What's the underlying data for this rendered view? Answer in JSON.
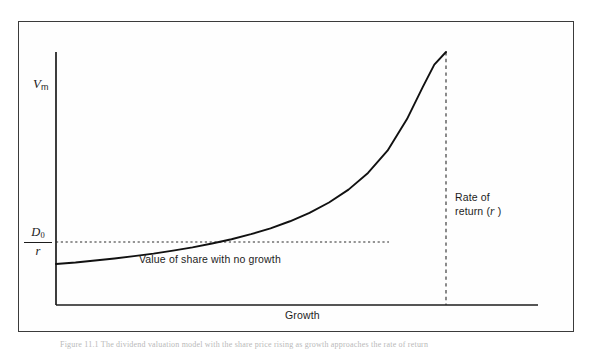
{
  "figure": {
    "kind": "line",
    "background_color": "#ffffff",
    "border_color": "#3b3b3b",
    "ink_color": "#1c1c1c",
    "caption": "Figure 11.1  The dividend valuation model with the share price rising as growth approaches the rate of return"
  },
  "axes": {
    "y_axis_label_main": "V",
    "y_axis_label_sub": "m",
    "x_axis_label": "Growth",
    "origin_value_numerator": "D",
    "origin_value_numerator_sub": "0",
    "origin_value_denominator": "r"
  },
  "annotations": {
    "asymptote_label": "Value of share with no growth",
    "vertical_asymptote_line1": "Rate of",
    "vertical_asymptote_line2": "return (",
    "vertical_asymptote_italic": "r",
    "vertical_asymptote_line3": " )"
  },
  "chart_data": {
    "type": "line",
    "title": "",
    "xlabel": "Growth",
    "ylabel": "Vm",
    "grid": false,
    "legend": "none",
    "xlim": [
      0,
      1
    ],
    "ylim": [
      0,
      1
    ],
    "series": [
      {
        "name": "Vm = D0 / (r - g)",
        "x": [
          0.0,
          0.05,
          0.1,
          0.15,
          0.2,
          0.25,
          0.3,
          0.35,
          0.4,
          0.45,
          0.5,
          0.55,
          0.6,
          0.65,
          0.7,
          0.75,
          0.8,
          0.85,
          0.9,
          0.94,
          0.97,
          1.0
        ],
        "y": [
          0.162,
          0.168,
          0.176,
          0.184,
          0.193,
          0.203,
          0.215,
          0.228,
          0.243,
          0.26,
          0.28,
          0.303,
          0.331,
          0.364,
          0.405,
          0.456,
          0.522,
          0.61,
          0.735,
          0.86,
          0.95,
          1.0
        ]
      }
    ],
    "reference_lines": [
      {
        "name": "no-growth-value",
        "orientation": "horizontal",
        "y": 0.162,
        "style": "dotted",
        "label": "Value of share with no growth"
      },
      {
        "name": "rate-of-return-asymptote",
        "orientation": "vertical",
        "x": 1.0,
        "style": "dashed",
        "label": "Rate of return (r)"
      }
    ]
  }
}
